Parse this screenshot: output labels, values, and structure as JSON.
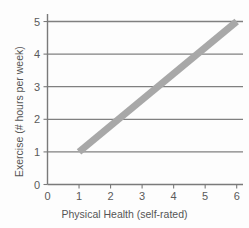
{
  "chart_data": {
    "type": "line",
    "title": "",
    "xlabel": "Physical Health (self-rated)",
    "ylabel": "Exercise (# hours per week)",
    "xlim": [
      0,
      6.2
    ],
    "ylim": [
      0,
      5.2
    ],
    "xticks": [
      0,
      1,
      2,
      3,
      4,
      5,
      6
    ],
    "yticks": [
      0,
      1,
      2,
      3,
      4,
      5
    ],
    "xtick_labels": [
      "0",
      "1",
      "2",
      "3",
      "4",
      "5",
      "6"
    ],
    "ytick_labels": [
      "0",
      "1",
      "2",
      "3",
      "4",
      "5"
    ],
    "grid": "horizontal",
    "gridlines_y": [
      1,
      2,
      3,
      4,
      5
    ],
    "legend": "none",
    "series": [
      {
        "name": "trend line",
        "color": "#a8a8a8",
        "linewidth": 7,
        "x": [
          1,
          6
        ],
        "values": [
          1,
          5
        ],
        "points": [
          {
            "x": 1,
            "y": 1
          },
          {
            "x": 2.25,
            "y": 2
          },
          {
            "x": 3.5,
            "y": 3
          },
          {
            "x": 4.75,
            "y": 4
          },
          {
            "x": 6,
            "y": 5
          }
        ]
      }
    ],
    "annotations": []
  },
  "style": {
    "background": "#fdfdfd",
    "axis_color": "#7a7a7a",
    "grid_color": "#808080",
    "line_color": "#a8a8a8",
    "tick_text_color": "#5a5a5a",
    "title_text_color": "#555555"
  }
}
